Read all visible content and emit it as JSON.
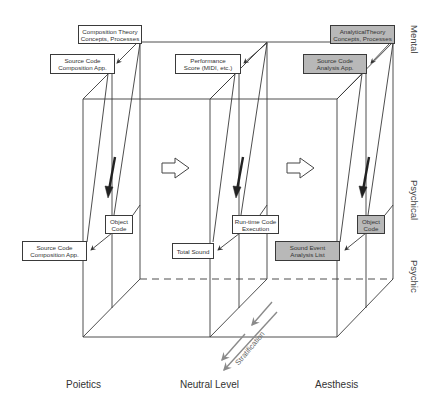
{
  "diagram": {
    "columns": [
      {
        "label": "Poietics",
        "theory_box": {
          "line1": "Composition Theory",
          "line2": "Concepts, Processes",
          "shaded": false
        },
        "mental_box": {
          "line1": "Source Code",
          "line2": "Composition App.",
          "shaded": false
        },
        "psychical_box": {
          "line1": "Object",
          "line2": "Code",
          "shaded": false
        },
        "psychic_box": {
          "line1": "Source Code",
          "line2": "Composition App.",
          "shaded": false
        }
      },
      {
        "label": "Neutral Level",
        "mental_box": {
          "line1": "Performance",
          "line2": "Score (MIDI, etc.)",
          "shaded": false
        },
        "psychical_box": {
          "line1": "Run-time Code",
          "line2": "Execution",
          "shaded": false
        },
        "psychic_box": {
          "line1": "Total Sound",
          "shaded": false
        }
      },
      {
        "label": "Aesthesis",
        "theory_box": {
          "line1": "AnalyticalTheory",
          "line2": "Concepts, Processes",
          "shaded": true
        },
        "mental_box": {
          "line1": "Source Code",
          "line2": "Analysis App.",
          "shaded": true
        },
        "psychical_box": {
          "line1": "Object",
          "line2": "Code",
          "shaded": true
        },
        "psychic_box": {
          "line1": "Sound Event",
          "line2": "Analysis List",
          "shaded": true
        }
      }
    ],
    "levels": [
      "Mental",
      "Psychical",
      "Psychic"
    ],
    "stratification_label": "Stratification",
    "colors": {
      "line": "#3a3a3a",
      "shaded_fill": "#b8b8b8",
      "strat_arrow": "#8a8a8a"
    }
  }
}
